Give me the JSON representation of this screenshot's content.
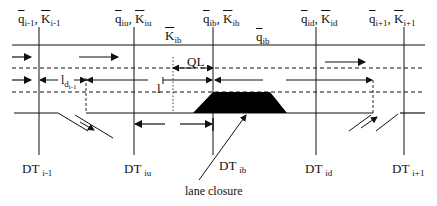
{
  "diagram": {
    "type": "freeway-segment-schematic",
    "top_labels": [
      {
        "id": "i-1",
        "q": "q",
        "K": "K",
        "sub": "i-1"
      },
      {
        "id": "iu",
        "q": "q",
        "K": "K",
        "sub": "iu"
      },
      {
        "id": "ib",
        "q": "q",
        "K": "K",
        "sub": "ib"
      },
      {
        "id": "id",
        "q": "q",
        "K": "K",
        "sub": "id"
      },
      {
        "id": "i+1",
        "q": "q",
        "K": "K",
        "sub": "i+1"
      }
    ],
    "inner_labels": {
      "K_ib": {
        "base": "K",
        "sub": "ib"
      },
      "q_ib": {
        "base": "q",
        "sub": "ib"
      },
      "QL": "QL",
      "l": "l",
      "l_d": {
        "base": "l",
        "sub": "d",
        "subsub": "i-1"
      }
    },
    "detectors": [
      {
        "base": "DT",
        "sub": "i-1"
      },
      {
        "base": "DT",
        "sub": "iu"
      },
      {
        "base": "DT",
        "sub": "ib"
      },
      {
        "base": "DT",
        "sub": "id"
      },
      {
        "base": "DT",
        "sub": "i+1"
      }
    ],
    "annotation": "lane closure",
    "colors": {
      "ink": "#111111",
      "background": "#ffffff"
    }
  }
}
